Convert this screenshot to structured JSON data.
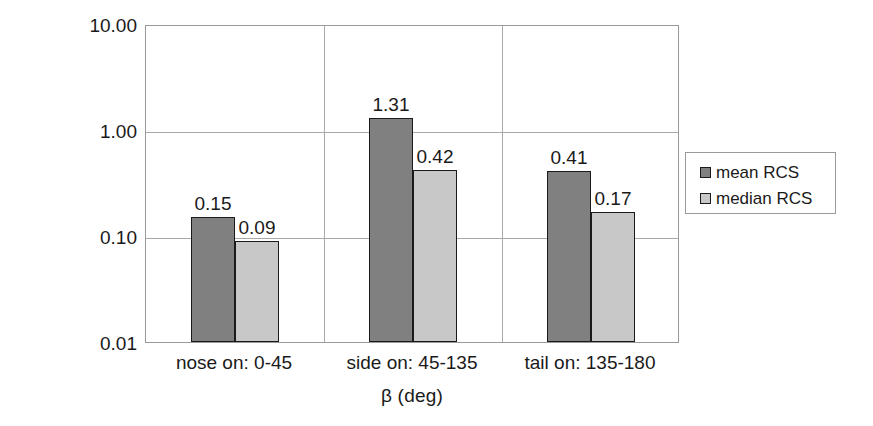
{
  "chart_data": {
    "type": "bar",
    "title": "",
    "subtitle": "",
    "xlabel": "β (deg)",
    "ylabel": "RCS (m",
    "ylabel_sup": "2",
    "ylabel_tail": ")",
    "ylabel_full": "RCS (m²)",
    "yscale": "log",
    "ylim": [
      0.01,
      10.0
    ],
    "grid": true,
    "legend_position": "right",
    "categories": [
      "nose on:  0-45",
      "side on: 45-135",
      "tail on: 135-180"
    ],
    "ytick_labels": [
      "10.00",
      "1.00",
      "0.10",
      "0.01"
    ],
    "ytick_values": [
      10.0,
      1.0,
      0.1,
      0.01
    ],
    "series": [
      {
        "name": "mean RCS",
        "color": "#808080",
        "values": [
          0.15,
          1.31,
          0.41
        ],
        "labels": [
          "0.15",
          "1.31",
          "0.41"
        ]
      },
      {
        "name": "median RCS",
        "color": "#c8c8c8",
        "values": [
          0.09,
          0.42,
          0.17
        ],
        "labels": [
          "0.09",
          "0.42",
          "0.17"
        ]
      }
    ]
  },
  "legend": {
    "items": [
      {
        "label": "mean RCS",
        "swatch": "mean"
      },
      {
        "label": "median RCS",
        "swatch": "median"
      }
    ]
  },
  "colors": {
    "mean_bar": "#808080",
    "median_bar": "#c8c8c8",
    "bar_outline": "#1a1a1a",
    "gridline": "#a8a8a8",
    "axis": "#9a9a9a",
    "text": "#1a1a1a",
    "background": "#ffffff"
  }
}
